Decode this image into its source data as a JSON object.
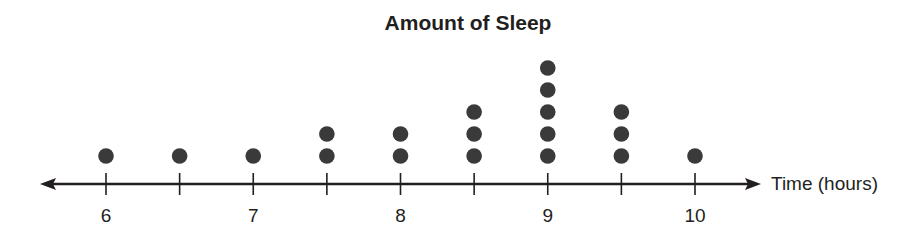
{
  "chart_data": {
    "type": "dot_plot",
    "title": "Amount of Sleep",
    "xlabel": "Time (hours)",
    "ylabel": "",
    "x_range": [
      6,
      10
    ],
    "tick_step": 0.5,
    "tick_labels": [
      {
        "value": 6,
        "label": "6"
      },
      {
        "value": 7,
        "label": "7"
      },
      {
        "value": 8,
        "label": "8"
      },
      {
        "value": 9,
        "label": "9"
      },
      {
        "value": 10,
        "label": "10"
      }
    ],
    "points": [
      {
        "x": 6,
        "count": 1
      },
      {
        "x": 6.5,
        "count": 1
      },
      {
        "x": 7,
        "count": 1
      },
      {
        "x": 7.5,
        "count": 2
      },
      {
        "x": 8,
        "count": 2
      },
      {
        "x": 8.5,
        "count": 3
      },
      {
        "x": 9,
        "count": 5
      },
      {
        "x": 9.5,
        "count": 3
      },
      {
        "x": 10,
        "count": 1
      }
    ],
    "grid": false,
    "legend": null,
    "dot_color": "#3a3a3a",
    "axis_color": "#231f20"
  }
}
